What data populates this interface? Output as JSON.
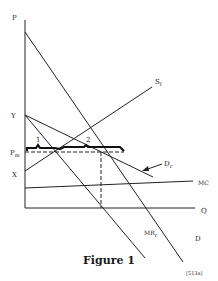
{
  "figure": {
    "caption": "Figure 1",
    "tag": "[513a]"
  },
  "axes": {
    "y_label": "P",
    "x_label": "Q"
  },
  "point_labels": {
    "Y": "Y",
    "X": "X",
    "Pm": "P",
    "Pm_sub": "m"
  },
  "curves": {
    "D": "D",
    "Sf": "S",
    "Sf_sub": "f",
    "Dr": "D",
    "Dr_sub": "r",
    "MRr": "MR",
    "MRr_sub": "r",
    "MC": "MC"
  },
  "brace_labels": {
    "one": "1",
    "two": "2"
  },
  "colors": {
    "ink": "#222222",
    "background": "#ffffff"
  }
}
